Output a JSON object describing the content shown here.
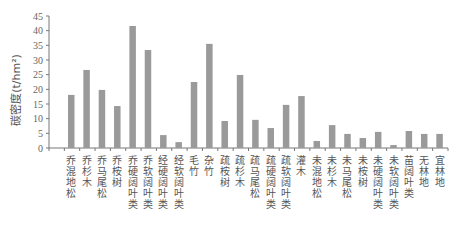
{
  "chart_data": {
    "type": "bar",
    "title": "",
    "xlabel": "",
    "ylabel": "碳密度(t/hm²)",
    "ylim": [
      0,
      45
    ],
    "yticks": [
      0,
      5,
      10,
      15,
      20,
      25,
      30,
      35,
      40,
      45
    ],
    "grid": false,
    "legend": null,
    "bar_color": "#9a9a9a",
    "categories": [
      "乔混地松",
      "乔杉木",
      "乔马尾松",
      "乔桉树",
      "乔硬阔叶类",
      "乔软阔叶类",
      "经硬阔叶类",
      "经软阔叶类",
      "毛竹",
      "杂竹",
      "疏桉树",
      "疏杉木",
      "疏马尾松",
      "疏硬阔叶类",
      "疏软阔叶类",
      "灌木",
      "未混地松",
      "未杉木",
      "未马尾松",
      "未桉树",
      "未硬阔叶类",
      "未软阔叶类",
      "苗阔叶类",
      "无林地",
      "宜林地"
    ],
    "values": [
      18.1,
      26.6,
      19.8,
      14.3,
      41.6,
      33.4,
      4.4,
      2.0,
      22.5,
      35.5,
      9.2,
      24.9,
      9.6,
      6.8,
      14.7,
      17.7,
      2.4,
      7.8,
      4.8,
      3.4,
      5.5,
      1.0,
      5.8,
      4.8,
      4.8
    ]
  }
}
